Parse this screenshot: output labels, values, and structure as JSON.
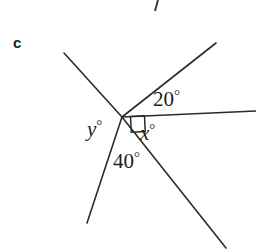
{
  "figure": {
    "part_label": "c",
    "background_color": "#ffffff",
    "stroke_color": "#2b2b2b",
    "canvas": {
      "width": 256,
      "height": 250
    },
    "vertex": {
      "x": 122,
      "y": 117
    },
    "rays": [
      {
        "name": "upper-left-ray",
        "x1": 122,
        "y1": 117,
        "x2": 64,
        "y2": 53
      },
      {
        "name": "upper-right-ray",
        "x1": 122,
        "y1": 117,
        "x2": 216,
        "y2": 43
      },
      {
        "name": "horizontal-right-ray",
        "x1": 122,
        "y1": 117,
        "x2": 256,
        "y2": 111
      },
      {
        "name": "lower-right-ray",
        "x1": 122,
        "y1": 117,
        "x2": 226,
        "y2": 248
      },
      {
        "name": "lower-left-ray",
        "x1": 122,
        "y1": 117,
        "x2": 87,
        "y2": 223
      }
    ],
    "stray_mark": {
      "name": "partial-line-fragment",
      "x1": 158,
      "y1": 0,
      "x2": 155,
      "y2": 11
    },
    "right_angle_marker": {
      "name": "right-angle-square",
      "between": [
        "horizontal-right-ray",
        "lower-right-ray"
      ],
      "points": "130.5,116.4 144.5,115.8 145.2,131.5 131.3,132.2"
    },
    "labels": {
      "angle_20": {
        "value": "20",
        "degree": "°",
        "left": 153,
        "top": 88
      },
      "angle_x": {
        "value": "x",
        "degree": "°",
        "left": 140,
        "top": 122
      },
      "angle_y": {
        "value": "y",
        "degree": "°",
        "left": 87,
        "top": 118
      },
      "angle_40": {
        "value": "40",
        "degree": "°",
        "left": 113,
        "top": 150
      }
    }
  }
}
